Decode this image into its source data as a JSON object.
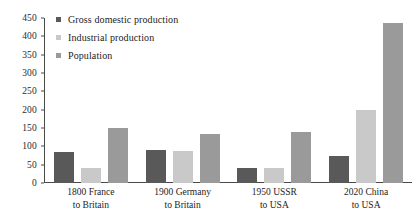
{
  "chart_data": {
    "type": "bar",
    "title": "",
    "xlabel": "",
    "ylabel": "",
    "ylim": [
      0,
      450
    ],
    "ytick_step": 50,
    "yticks": [
      450,
      400,
      350,
      300,
      250,
      200,
      150,
      100,
      50,
      0
    ],
    "grid": false,
    "legend_position": "top-left-inside",
    "categories": [
      "1800 France to Britain",
      "1900 Germany to Britain",
      "1950 USSR to USA",
      "2020 China to USA"
    ],
    "category_lines": [
      [
        "1800 France",
        "to Britain"
      ],
      [
        "1900 Germany",
        "to Britain"
      ],
      [
        "1950 USSR",
        "to USA"
      ],
      [
        "2020 China",
        "to USA"
      ]
    ],
    "series": [
      {
        "name": "Gross domestic production",
        "color": "#595959",
        "values": [
          85,
          90,
          40,
          75
        ]
      },
      {
        "name": "Industrial production",
        "color": "#c9c9c9",
        "values": [
          42,
          88,
          40,
          200
        ]
      },
      {
        "name": "Population",
        "color": "#9a9a9a",
        "values": [
          150,
          135,
          140,
          437
        ]
      }
    ]
  },
  "colors": {
    "axis": "#4a4a4a",
    "text": "#1d1d1d",
    "background": "#ffffff",
    "series_gdp": "#595959",
    "series_industrial": "#c9c9c9",
    "series_population": "#9a9a9a"
  }
}
